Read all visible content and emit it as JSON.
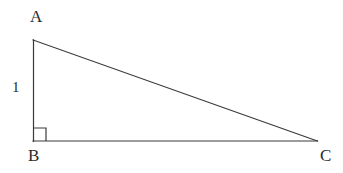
{
  "figure": {
    "background_color": "#ffffff",
    "stroke_color": "#3a3a3a",
    "stroke_width": 1.2,
    "vertices": [
      {
        "name": "A",
        "label": "A",
        "x": 33,
        "y": 40
      },
      {
        "name": "B",
        "label": "B",
        "x": 33,
        "y": 141
      },
      {
        "name": "C",
        "label": "C",
        "x": 317,
        "y": 141
      }
    ],
    "sides": [
      {
        "name": "AB",
        "label": "1",
        "from": "A",
        "to": "B"
      },
      {
        "name": "BC",
        "label": "",
        "from": "B",
        "to": "C"
      },
      {
        "name": "CA",
        "label": "",
        "from": "C",
        "to": "A"
      }
    ],
    "right_angle": {
      "at_vertex": "B",
      "marker": "square",
      "size": 13
    },
    "labels": {
      "vertex_a": "A",
      "vertex_b": "B",
      "vertex_c": "C",
      "side_ab": "1"
    }
  }
}
